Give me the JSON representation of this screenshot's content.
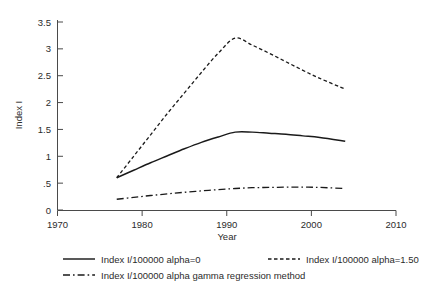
{
  "chart_data": {
    "type": "line",
    "title": "",
    "xlabel": "Year",
    "ylabel": "Index I",
    "xlim": [
      1970,
      2010
    ],
    "ylim": [
      0,
      3.5
    ],
    "xticks": [
      1970,
      1980,
      1990,
      2000,
      2010
    ],
    "xticklabels": [
      "1970",
      "1980",
      "1990",
      "2000",
      "2010"
    ],
    "yticks": [
      0,
      0.5,
      1,
      1.5,
      2,
      2.5,
      3,
      3.5
    ],
    "yticklabels": [
      "0",
      ".5",
      "1",
      "1.5",
      "2",
      "2.5",
      "3",
      "3.5"
    ],
    "grid": false,
    "legend_position": "below-axes",
    "x": [
      1977,
      1979,
      1981,
      1983,
      1985,
      1987,
      1989,
      1991,
      1993,
      1995,
      1997,
      1999,
      2001,
      2004
    ],
    "series": [
      {
        "name": "Index I/100000 alpha=0",
        "style": "solid",
        "color": "#1a1a1a",
        "values": [
          0.6,
          0.74,
          0.88,
          1.01,
          1.14,
          1.26,
          1.36,
          1.45,
          1.45,
          1.43,
          1.41,
          1.38,
          1.35,
          1.28
        ]
      },
      {
        "name": "Index I/100000 alpha=1.50",
        "style": "dashed",
        "color": "#1a1a1a",
        "values": [
          0.6,
          1.0,
          1.4,
          1.8,
          2.18,
          2.56,
          2.92,
          3.2,
          3.07,
          2.92,
          2.76,
          2.6,
          2.45,
          2.25
        ]
      },
      {
        "name": "Index I/100000 alpha gamma regression method",
        "style": "dash-dot",
        "color": "#1a1a1a",
        "values": [
          0.2,
          0.235,
          0.27,
          0.3,
          0.33,
          0.355,
          0.38,
          0.4,
          0.415,
          0.42,
          0.425,
          0.425,
          0.42,
          0.4
        ]
      }
    ]
  },
  "axes": {
    "y_title": "Index I",
    "x_title": "Year"
  },
  "legend": {
    "entries": [
      {
        "label": "Index I/100000 alpha=0",
        "style": "solid"
      },
      {
        "label": "Index I/100000 alpha=1.50",
        "style": "dashed"
      },
      {
        "label": "Index I/100000 alpha gamma regression method",
        "style": "dash-dot"
      }
    ]
  }
}
